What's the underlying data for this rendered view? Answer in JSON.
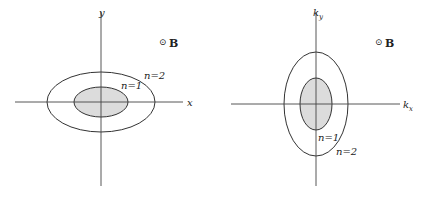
{
  "left_panel": {
    "axis_x_label": "x",
    "axis_y_label": "y",
    "field_symbol": "⊙",
    "field_label": "B",
    "inner_label": "n=1",
    "outer_label": "n=2",
    "inner_ellipse": {
      "cx": 101,
      "cy": 102,
      "rx": 27,
      "ry": 15,
      "fill": "#dcdcdc"
    },
    "outer_ellipse": {
      "cx": 101,
      "cy": 102,
      "rx": 54,
      "ry": 30
    }
  },
  "right_panel": {
    "axis_x_label": "k",
    "axis_x_sub": "x",
    "axis_y_label": "k",
    "axis_y_sub": "y",
    "field_symbol": "⊙",
    "field_label": "B",
    "inner_label": "n=1",
    "outer_label": "n=2",
    "inner_ellipse": {
      "cx": 316,
      "cy": 104,
      "rx": 16,
      "ry": 26,
      "fill": "#dcdcdc"
    },
    "outer_ellipse": {
      "cx": 316,
      "cy": 104,
      "rx": 32,
      "ry": 52
    }
  },
  "colors": {
    "line": "#333333",
    "fill": "#dcdcdc"
  }
}
